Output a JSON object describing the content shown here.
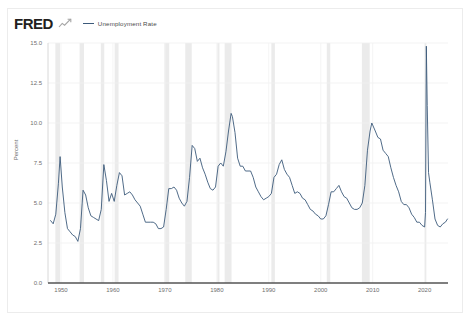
{
  "header": {
    "brand": "FRED",
    "brand_mark_icon": "fred-chart-icon",
    "legend": [
      {
        "label": "Unemployment Rate",
        "color": "#3c5a7a"
      }
    ]
  },
  "chart_data": {
    "type": "line",
    "title": "",
    "xlabel": "",
    "ylabel": "Percent",
    "xlim": [
      1947.5,
      2024.5
    ],
    "ylim": [
      0.0,
      15.0
    ],
    "grid": true,
    "legend_position": "top-left",
    "y_ticks": [
      "15.0",
      "12.5",
      "10.0",
      "7.5",
      "5.0",
      "2.5",
      "0.0"
    ],
    "y_tick_values": [
      15.0,
      12.5,
      10.0,
      7.5,
      5.0,
      2.5,
      0.0
    ],
    "x_ticks": [
      "1950",
      "1960",
      "1970",
      "1980",
      "1990",
      "2000",
      "2010",
      "2020"
    ],
    "x_tick_values": [
      1950,
      1960,
      1970,
      1980,
      1990,
      2000,
      2010,
      2020
    ],
    "line_color": "#3c5a7a",
    "recession_band_color": "#ebebeb",
    "recessions": [
      [
        1948.92,
        1949.83
      ],
      [
        1953.58,
        1954.42
      ],
      [
        1957.67,
        1958.33
      ],
      [
        1960.33,
        1961.08
      ],
      [
        1969.92,
        1970.83
      ],
      [
        1973.92,
        1975.17
      ],
      [
        1980.08,
        1980.5
      ],
      [
        1981.5,
        1982.83
      ],
      [
        1990.5,
        1991.17
      ],
      [
        2001.17,
        2001.83
      ],
      [
        2007.92,
        2009.42
      ],
      [
        2020.08,
        2020.33
      ]
    ],
    "series": [
      {
        "name": "Unemployment Rate",
        "x": [
          1948.0,
          1948.5,
          1949.0,
          1949.5,
          1949.83,
          1950.25,
          1950.75,
          1951.25,
          1951.75,
          1952.25,
          1952.75,
          1953.25,
          1953.75,
          1954.25,
          1954.75,
          1955.25,
          1955.75,
          1956.25,
          1956.75,
          1957.25,
          1957.75,
          1958.25,
          1958.75,
          1959.25,
          1959.75,
          1960.25,
          1960.75,
          1961.25,
          1961.75,
          1962.25,
          1962.75,
          1963.25,
          1963.75,
          1964.25,
          1964.75,
          1965.25,
          1965.75,
          1966.25,
          1966.75,
          1967.25,
          1967.75,
          1968.25,
          1968.75,
          1969.25,
          1969.75,
          1970.25,
          1970.75,
          1971.25,
          1971.75,
          1972.25,
          1972.75,
          1973.25,
          1973.75,
          1974.25,
          1974.75,
          1975.25,
          1975.75,
          1976.25,
          1976.75,
          1977.25,
          1977.75,
          1978.25,
          1978.75,
          1979.25,
          1979.75,
          1980.25,
          1980.75,
          1981.25,
          1981.75,
          1982.25,
          1982.75,
          1983.0,
          1983.5,
          1984.0,
          1984.5,
          1985.0,
          1985.5,
          1986.0,
          1986.5,
          1987.0,
          1987.5,
          1988.0,
          1988.5,
          1989.0,
          1989.5,
          1990.0,
          1990.5,
          1991.0,
          1991.5,
          1992.0,
          1992.5,
          1993.0,
          1993.5,
          1994.0,
          1994.5,
          1995.0,
          1995.5,
          1996.0,
          1996.5,
          1997.0,
          1997.5,
          1998.0,
          1998.5,
          1999.0,
          1999.5,
          2000.0,
          2000.5,
          2001.0,
          2001.5,
          2002.0,
          2002.5,
          2003.0,
          2003.5,
          2004.0,
          2004.5,
          2005.0,
          2005.5,
          2006.0,
          2006.5,
          2007.0,
          2007.5,
          2008.0,
          2008.5,
          2009.0,
          2009.5,
          2009.83,
          2010.5,
          2011.0,
          2011.5,
          2012.0,
          2012.5,
          2013.0,
          2013.5,
          2014.0,
          2014.5,
          2015.0,
          2015.5,
          2016.0,
          2016.5,
          2017.0,
          2017.5,
          2018.0,
          2018.5,
          2019.0,
          2019.5,
          2020.0,
          2020.17,
          2020.33,
          2020.5,
          2020.75,
          2021.0,
          2021.5,
          2022.0,
          2022.5,
          2023.0,
          2023.5,
          2024.0,
          2024.4
        ],
        "values": [
          3.9,
          3.7,
          4.3,
          6.2,
          7.9,
          6.0,
          4.4,
          3.4,
          3.2,
          3.0,
          2.9,
          2.6,
          3.4,
          5.8,
          5.5,
          4.7,
          4.2,
          4.1,
          4.0,
          3.9,
          4.6,
          7.4,
          6.4,
          5.1,
          5.6,
          5.1,
          6.1,
          6.9,
          6.7,
          5.5,
          5.6,
          5.7,
          5.5,
          5.2,
          5.0,
          4.8,
          4.3,
          3.8,
          3.8,
          3.8,
          3.8,
          3.7,
          3.4,
          3.4,
          3.5,
          4.6,
          5.9,
          5.9,
          6.0,
          5.8,
          5.3,
          5.0,
          4.8,
          5.1,
          6.6,
          8.6,
          8.4,
          7.6,
          7.8,
          7.2,
          6.8,
          6.3,
          5.9,
          5.8,
          6.0,
          7.3,
          7.5,
          7.3,
          8.2,
          9.5,
          10.6,
          10.4,
          9.4,
          7.8,
          7.3,
          7.3,
          7.0,
          7.0,
          7.0,
          6.6,
          6.0,
          5.7,
          5.4,
          5.2,
          5.3,
          5.4,
          5.6,
          6.6,
          6.8,
          7.4,
          7.7,
          7.1,
          6.8,
          6.6,
          6.1,
          5.6,
          5.7,
          5.6,
          5.3,
          5.2,
          4.9,
          4.6,
          4.5,
          4.3,
          4.2,
          4.0,
          4.0,
          4.2,
          4.9,
          5.7,
          5.7,
          5.9,
          6.1,
          5.7,
          5.4,
          5.3,
          5.0,
          4.7,
          4.6,
          4.6,
          4.7,
          5.0,
          6.1,
          8.3,
          9.5,
          10.0,
          9.5,
          9.1,
          9.0,
          8.3,
          8.1,
          7.9,
          7.2,
          6.6,
          6.1,
          5.7,
          5.1,
          4.9,
          4.9,
          4.7,
          4.3,
          4.1,
          3.8,
          3.8,
          3.6,
          3.5,
          4.4,
          14.8,
          11.1,
          6.9,
          6.3,
          5.2,
          4.0,
          3.6,
          3.5,
          3.7,
          3.8,
          4.0
        ]
      }
    ]
  }
}
